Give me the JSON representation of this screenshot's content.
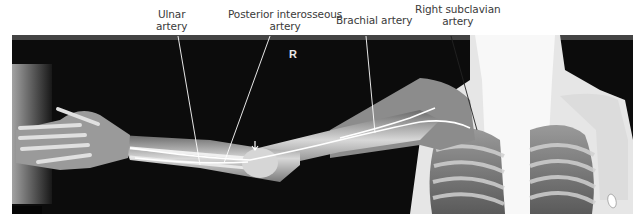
{
  "figure": {
    "side_marker": "R",
    "labels": [
      {
        "id": "ulnar",
        "line1": "Ulnar",
        "line2": "artery"
      },
      {
        "id": "posterior-interosseous",
        "line1": "Posterior interosseous",
        "line2": "artery"
      },
      {
        "id": "brachial",
        "line1": "Brachial artery",
        "line2": ""
      },
      {
        "id": "right-subclavian",
        "line1": "Right subclavian",
        "line2": "artery"
      }
    ]
  },
  "colors": {
    "background": "#ffffff",
    "xray_dark": "#0a0a0a",
    "bone_bright": "#f0f0f0",
    "label_text": "#3a3a3a",
    "leader_line": "#ffffff"
  }
}
